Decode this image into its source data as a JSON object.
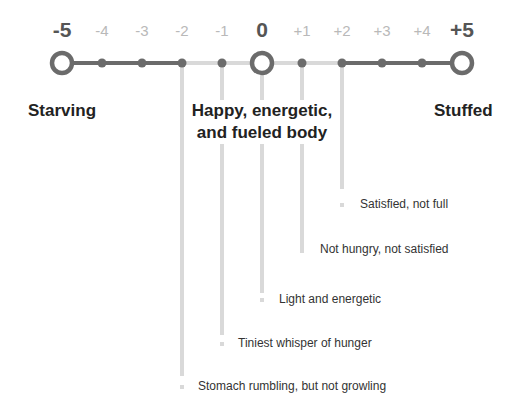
{
  "scale": {
    "ticks": [
      {
        "label": "-5",
        "x": 62,
        "major": true
      },
      {
        "label": "-4",
        "x": 102,
        "major": false
      },
      {
        "label": "-3",
        "x": 142,
        "major": false
      },
      {
        "label": "-2",
        "x": 182,
        "major": false
      },
      {
        "label": "-1",
        "x": 222,
        "major": false
      },
      {
        "label": "0",
        "x": 262,
        "major": true
      },
      {
        "label": "+1",
        "x": 302,
        "major": false
      },
      {
        "label": "+2",
        "x": 342,
        "major": false
      },
      {
        "label": "+3",
        "x": 382,
        "major": false
      },
      {
        "label": "+4",
        "x": 422,
        "major": false
      },
      {
        "label": "+5",
        "x": 462,
        "major": true
      }
    ],
    "colors": {
      "dark": "#6b6b6b",
      "light": "#d9d9d9",
      "major_text": "#555555",
      "minor_text": "#b9b9b9"
    }
  },
  "zones": {
    "left": "Starving",
    "center_line1": "Happy, energetic,",
    "center_line2": "and fueled body",
    "right": "Stuffed"
  },
  "descriptions": [
    {
      "value": "+2",
      "text": "Satisfied, not full"
    },
    {
      "value": "+1",
      "text": "Not hungry, not satisfied"
    },
    {
      "value": "0",
      "text": "Light and energetic"
    },
    {
      "value": "-1",
      "text": "Tiniest whisper of hunger"
    },
    {
      "value": "-2",
      "text": "Stomach rumbling, but not growling"
    }
  ]
}
